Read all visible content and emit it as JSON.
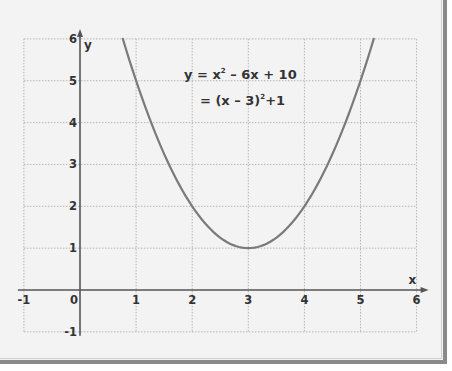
{
  "chart_data": {
    "type": "line",
    "title": "",
    "xlabel": "x",
    "ylabel": "y",
    "xlim": [
      -1,
      6
    ],
    "ylim": [
      -1,
      6
    ],
    "grid": true,
    "x_ticks": [
      "-1",
      "0",
      "1",
      "2",
      "3",
      "4",
      "5",
      "6"
    ],
    "y_ticks": [
      "6",
      "5",
      "4",
      "3",
      "2",
      "1",
      "-1"
    ],
    "annotation": {
      "line1": {
        "lhs": "y = x",
        "exp": "2",
        "rhs": " – 6x + 10"
      },
      "line2": {
        "lhs": "= (x – 3)",
        "exp": "2",
        "rhs": "+1"
      }
    },
    "series": [
      {
        "name": "y = x^2 - 6x + 10",
        "function": {
          "a": 1,
          "b": -6,
          "c": 10
        },
        "x_range": [
          0.764,
          5.236
        ],
        "vertex": [
          3,
          1
        ],
        "color": "#7a7a7a"
      }
    ]
  },
  "colors": {
    "background": "#f3f3f3",
    "frame_border": "#8a8a8a",
    "axis": "#555555",
    "grid": "#b5b5b5",
    "text": "#333333"
  }
}
